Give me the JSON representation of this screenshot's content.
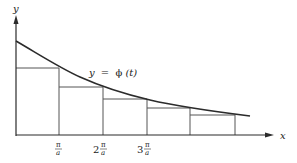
{
  "diagram": {
    "type": "step-function-under-curve",
    "axes": {
      "x_label": "x",
      "y_label": "y"
    },
    "curve_label": "y = ϕ(t)",
    "curve_label_parts": {
      "lhs": "y",
      "eq": "=",
      "phi": "ϕ",
      "arg": "(t)"
    },
    "tick_labels": [
      {
        "coef": "",
        "num": "π",
        "den": "a"
      },
      {
        "coef": "2",
        "num": "π",
        "den": "a"
      },
      {
        "coef": "3",
        "num": "π",
        "den": "a"
      }
    ],
    "colors": {
      "line": "#2b2b2b",
      "thin_line": "#555555",
      "background": "#ffffff"
    },
    "step_count": 5
  }
}
